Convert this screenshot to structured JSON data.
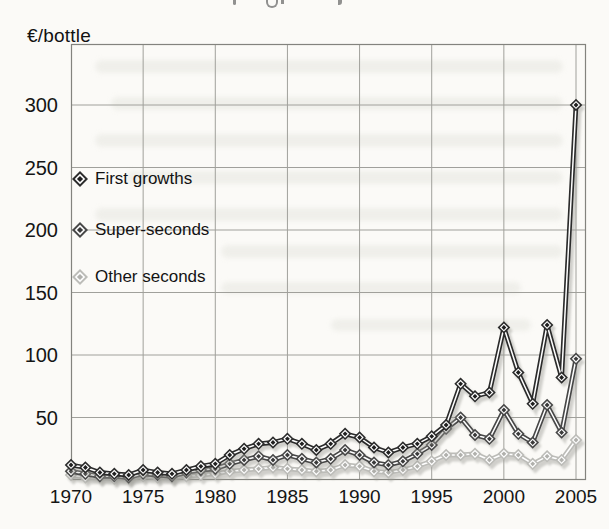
{
  "page": {
    "unit_label": "€/bottle"
  },
  "chart_data": {
    "type": "line",
    "title": "",
    "unit_label": "€/bottle",
    "xlabel": "",
    "ylabel": "€/bottle",
    "grid": true,
    "legend_position": "upper-left-inside",
    "xlim": [
      1970,
      2005.7
    ],
    "ylim": [
      0,
      349
    ],
    "x_ticks": [
      1970,
      1975,
      1980,
      1985,
      1990,
      1995,
      2000,
      2005
    ],
    "y_ticks": [
      50,
      100,
      150,
      200,
      250,
      300
    ],
    "years": [
      1970,
      1971,
      1972,
      1973,
      1974,
      1975,
      1976,
      1977,
      1978,
      1979,
      1980,
      1981,
      1982,
      1983,
      1984,
      1985,
      1986,
      1987,
      1988,
      1989,
      1990,
      1991,
      1992,
      1993,
      1994,
      1995,
      1996,
      1997,
      1998,
      1999,
      2000,
      2001,
      2002,
      2003,
      2004,
      2005
    ],
    "series": [
      {
        "name": "First growths",
        "color": "#2b2b2b",
        "center_color": "#1f1f1f",
        "values": [
          12,
          10,
          6,
          5,
          4,
          8,
          6,
          5,
          8,
          11,
          13,
          20,
          25,
          29,
          30,
          33,
          29,
          24,
          29,
          37,
          34,
          26,
          22,
          26,
          29,
          35,
          44,
          77,
          67,
          70,
          122,
          86,
          61,
          124,
          82,
          300
        ]
      },
      {
        "name": "Super-seconds",
        "color": "#474747",
        "center_color": "#3a3a3a",
        "values": [
          7,
          5,
          3,
          3,
          2,
          5,
          4,
          3,
          6,
          8,
          9,
          13,
          16,
          19,
          16,
          20,
          17,
          14,
          17,
          24,
          20,
          14,
          12,
          15,
          21,
          28,
          41,
          50,
          36,
          33,
          56,
          37,
          30,
          60,
          38,
          97
        ]
      },
      {
        "name": "Other seconds",
        "color": "#bcbcb8",
        "center_color": "#b0b0ac",
        "values": [
          4,
          2,
          2,
          1,
          1,
          3,
          2,
          2,
          3,
          4,
          5,
          7,
          8,
          9,
          10,
          9,
          8,
          7,
          8,
          12,
          11,
          7,
          6,
          8,
          11,
          15,
          20,
          20,
          21,
          16,
          21,
          20,
          13,
          19,
          16,
          32
        ]
      }
    ]
  }
}
